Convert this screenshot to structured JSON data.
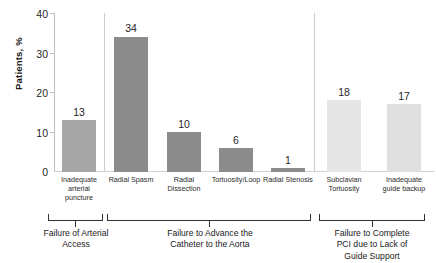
{
  "chart_data": {
    "type": "bar",
    "title": "",
    "xlabel": "",
    "ylabel": "Patients, %",
    "ylim": [
      0,
      40
    ],
    "yticks": [
      0,
      10,
      20,
      30,
      40
    ],
    "grid": false,
    "legend": "none",
    "categories": [
      "Inadequate arterial puncture",
      "Radial Spasm",
      "Radial Dissection",
      "Tortuosity/Loop",
      "Radial Stenosis",
      "Subclavian Tortuosity",
      "Inadequate guide backup"
    ],
    "values": [
      13,
      34,
      10,
      6,
      1,
      18,
      17
    ],
    "bar_colors": [
      "#a6a6a6",
      "#8c8c8c",
      "#8c8c8c",
      "#8c8c8c",
      "#8c8c8c",
      "#e6e6e6",
      "#e0e0e0"
    ],
    "groups": [
      {
        "label": "Failure of Arterial Access",
        "categories": [
          0
        ]
      },
      {
        "label": "Failure to Advance the Catheter to the Aorta",
        "categories": [
          1,
          2,
          3,
          4
        ]
      },
      {
        "label": "Failure to Complete PCI due to Lack of Guide Support",
        "categories": [
          5,
          6
        ]
      }
    ]
  },
  "axis": {
    "y_label": "Patients, %",
    "y_ticks": [
      "40",
      "30",
      "20",
      "10",
      "0"
    ]
  },
  "bars": [
    {
      "label_lines": [
        "Inadequate",
        "arterial",
        "puncture"
      ],
      "value": "13"
    },
    {
      "label_lines": [
        "Radial Spasm"
      ],
      "value": "34"
    },
    {
      "label_lines": [
        "Radial",
        "Dissection"
      ],
      "value": "10"
    },
    {
      "label_lines": [
        "Tortuosity/Loop"
      ],
      "value": "6"
    },
    {
      "label_lines": [
        "Radial Stenosis"
      ],
      "value": "1"
    },
    {
      "label_lines": [
        "Subclavian",
        "Tortuosity"
      ],
      "value": "18"
    },
    {
      "label_lines": [
        "Inadequate",
        "guide backup"
      ],
      "value": "17"
    }
  ],
  "groups": [
    {
      "lines": [
        "Failure of Arterial",
        "Access"
      ]
    },
    {
      "lines": [
        "Failure to Advance the",
        "Catheter to the Aorta"
      ]
    },
    {
      "lines": [
        "Failure to Complete",
        "PCI due to Lack of",
        "Guide Support"
      ]
    }
  ]
}
